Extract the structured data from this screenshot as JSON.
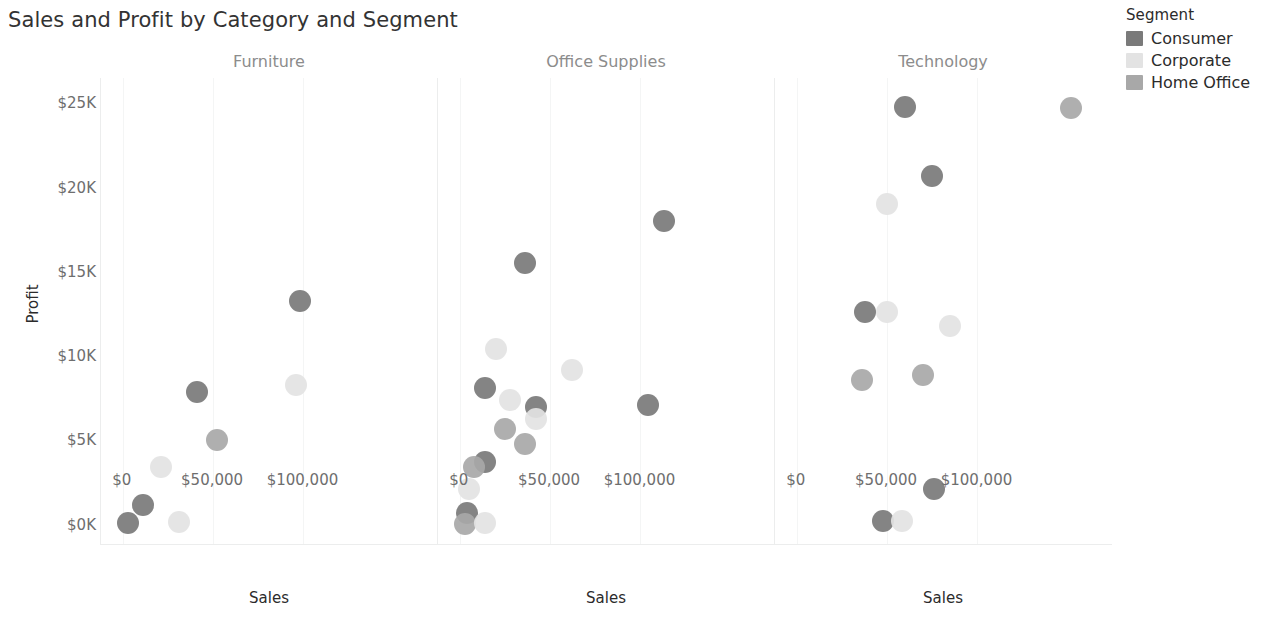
{
  "title": "Sales and Profit by Category and Segment",
  "legend": {
    "title": "Segment",
    "items": [
      {
        "label": "Consumer",
        "color": "#7a7a7a"
      },
      {
        "label": "Corporate",
        "color": "#e3e3e3"
      },
      {
        "label": "Home Office",
        "color": "#a8a8a8"
      }
    ]
  },
  "axes": {
    "ylabel": "Profit",
    "xlabel": "Sales",
    "yticks": [
      "$0K",
      "$5K",
      "$10K",
      "$15K",
      "$20K",
      "$25K"
    ],
    "ytick_values": [
      0,
      5000,
      10000,
      15000,
      20000,
      25000
    ],
    "xticks": [
      "$0",
      "$50,000",
      "$100,000"
    ],
    "xtick_values": [
      0,
      50000,
      100000
    ],
    "ylim": [
      -1200,
      26500
    ],
    "xlim": [
      -12000,
      175000
    ]
  },
  "chart_data": {
    "type": "scatter",
    "title": "Sales and Profit by Category and Segment",
    "xlabel": "Sales",
    "ylabel": "Profit",
    "facet_by": "Category",
    "color_by": "Segment",
    "legend_position": "right",
    "grid": false,
    "xlim": [
      -12000,
      175000
    ],
    "ylim": [
      -1200,
      26500
    ],
    "panels": [
      {
        "name": "Furniture",
        "points": [
          {
            "segment": "Consumer",
            "sales": 98000,
            "profit": 13300
          },
          {
            "segment": "Consumer",
            "sales": 41000,
            "profit": 7900
          },
          {
            "segment": "Corporate",
            "sales": 96000,
            "profit": 8300
          },
          {
            "segment": "Home Office",
            "sales": 52000,
            "profit": 5000
          },
          {
            "segment": "Corporate",
            "sales": 21000,
            "profit": 3400
          },
          {
            "segment": "Consumer",
            "sales": 11000,
            "profit": 1200
          },
          {
            "segment": "Consumer",
            "sales": 3000,
            "profit": 100
          },
          {
            "segment": "Corporate",
            "sales": 31000,
            "profit": 150
          }
        ]
      },
      {
        "name": "Office Supplies",
        "points": [
          {
            "segment": "Consumer",
            "sales": 113000,
            "profit": 18000
          },
          {
            "segment": "Consumer",
            "sales": 36000,
            "profit": 15500
          },
          {
            "segment": "Corporate",
            "sales": 20000,
            "profit": 10400
          },
          {
            "segment": "Corporate",
            "sales": 62000,
            "profit": 9200
          },
          {
            "segment": "Consumer",
            "sales": 14000,
            "profit": 8100
          },
          {
            "segment": "Consumer",
            "sales": 104000,
            "profit": 7100
          },
          {
            "segment": "Corporate",
            "sales": 28000,
            "profit": 7400
          },
          {
            "segment": "Consumer",
            "sales": 42000,
            "profit": 7000
          },
          {
            "segment": "Corporate",
            "sales": 42000,
            "profit": 6300
          },
          {
            "segment": "Home Office",
            "sales": 25000,
            "profit": 5700
          },
          {
            "segment": "Home Office",
            "sales": 36000,
            "profit": 4800
          },
          {
            "segment": "Consumer",
            "sales": 14000,
            "profit": 3700
          },
          {
            "segment": "Home Office",
            "sales": 8000,
            "profit": 3400
          },
          {
            "segment": "Corporate",
            "sales": 5000,
            "profit": 2100
          },
          {
            "segment": "Consumer",
            "sales": 4000,
            "profit": 700
          },
          {
            "segment": "Home Office",
            "sales": 3000,
            "profit": 50
          },
          {
            "segment": "Corporate",
            "sales": 14000,
            "profit": 100
          }
        ]
      },
      {
        "name": "Technology",
        "points": [
          {
            "segment": "Consumer",
            "sales": 60000,
            "profit": 24800
          },
          {
            "segment": "Home Office",
            "sales": 152000,
            "profit": 24700
          },
          {
            "segment": "Consumer",
            "sales": 75000,
            "profit": 20700
          },
          {
            "segment": "Corporate",
            "sales": 50000,
            "profit": 19000
          },
          {
            "segment": "Consumer",
            "sales": 38000,
            "profit": 12600
          },
          {
            "segment": "Corporate",
            "sales": 50000,
            "profit": 12600
          },
          {
            "segment": "Corporate",
            "sales": 85000,
            "profit": 11800
          },
          {
            "segment": "Home Office",
            "sales": 36000,
            "profit": 8600
          },
          {
            "segment": "Home Office",
            "sales": 70000,
            "profit": 8900
          },
          {
            "segment": "Consumer",
            "sales": 76000,
            "profit": 2100
          },
          {
            "segment": "Consumer",
            "sales": 48000,
            "profit": 200
          },
          {
            "segment": "Corporate",
            "sales": 58000,
            "profit": 250
          }
        ]
      }
    ]
  },
  "layout": {
    "panel_lefts": [
      100,
      437,
      774
    ],
    "panel_width": 338,
    "panel_top": 78,
    "panel_height": 467
  }
}
